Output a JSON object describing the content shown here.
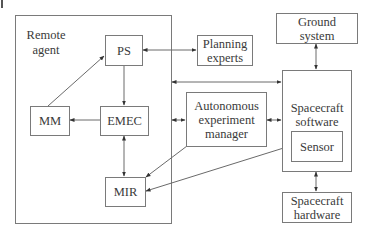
{
  "diagram": {
    "container": {
      "label": "Remote\nagent"
    },
    "nodes": {
      "ps": {
        "label": "PS"
      },
      "mm": {
        "label": "MM"
      },
      "emec": {
        "label": "EMEC"
      },
      "mir": {
        "label": "MIR"
      },
      "planning_experts": {
        "label": "Planning\nexperts"
      },
      "aem": {
        "label": "Autonomous\nexperiment\nmanager"
      },
      "ground_system": {
        "label": "Ground\nsystem"
      },
      "spacecraft_software": {
        "label": "Spacecraft\nsoftware"
      },
      "sensor": {
        "label": "Sensor"
      },
      "spacecraft_hardware": {
        "label": "Spacecraft\nhardware"
      }
    },
    "edges": [
      {
        "from": "MM",
        "to": "PS",
        "direction": "forward"
      },
      {
        "from": "PS",
        "to": "EMEC",
        "direction": "forward"
      },
      {
        "from": "EMEC",
        "to": "MM",
        "direction": "forward"
      },
      {
        "from": "EMEC",
        "to": "MIR",
        "direction": "both"
      },
      {
        "from": "PS",
        "to": "Planning experts",
        "direction": "both"
      },
      {
        "from": "Remote agent",
        "to": "Spacecraft software",
        "direction": "both"
      },
      {
        "from": "Remote agent",
        "to": "Autonomous experiment manager",
        "direction": "both"
      },
      {
        "from": "Autonomous experiment manager",
        "to": "Spacecraft software",
        "direction": "both"
      },
      {
        "from": "Autonomous experiment manager",
        "to": "MIR",
        "direction": "forward"
      },
      {
        "from": "MIR",
        "to": "Sensor",
        "direction": "both"
      },
      {
        "from": "Ground system",
        "to": "Spacecraft software",
        "direction": "both"
      },
      {
        "from": "Spacecraft software",
        "to": "Spacecraft hardware",
        "direction": "both"
      }
    ],
    "colors": {
      "stroke": "#7a7a7a",
      "arrow": "#333333",
      "text": "#3a3a3a"
    }
  }
}
